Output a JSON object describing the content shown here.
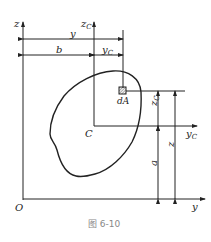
{
  "diagram": {
    "caption": "图 6-10",
    "axes": {
      "z": "z",
      "y": "y",
      "origin": "O",
      "zc": "z",
      "zc_sub": "C",
      "yc": "y",
      "yc_sub": "C"
    },
    "centroid_label": "C",
    "element_label": "dA",
    "dimensions": {
      "y": "y",
      "b": "b",
      "yc": "y",
      "yc_sub": "C",
      "zc": "z",
      "zc_sub": "C",
      "a": "a",
      "z": "z"
    },
    "colors": {
      "line": "#222222",
      "caption": "#888888"
    }
  }
}
